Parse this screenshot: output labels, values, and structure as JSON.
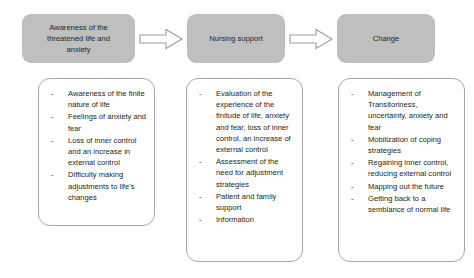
{
  "diagram": {
    "colors": {
      "header_fill": "#bfbfbf",
      "box_border": "#a6a6a6",
      "text": "#231f20",
      "background": "#ffffff"
    },
    "bullet_marker": "-",
    "arrows": [
      {
        "name": "arrow-stage-1-to-2",
        "direction": "right"
      },
      {
        "name": "arrow-stage-2-to-3",
        "direction": "right"
      }
    ],
    "stages": [
      {
        "header": "Awareness of the\nthreatened life and\nanxiety",
        "items": [
          "Awareness of the finite nature of life",
          "Feelings of anxiety and fear",
          "Loss of inner control and an increase in external control",
          "Difficulty making adjustments to life's changes"
        ]
      },
      {
        "header": "Nursing support",
        "items": [
          "Evaluation of the experience of the finitude of life, anxiety and fear, loss of inner control, an increase of external control",
          "Assessment of the need for adjustment strategies",
          "Patient and family support",
          "Information"
        ]
      },
      {
        "header": "Change",
        "items": [
          "Management of Transitoriness, uncertainty, anxiety and fear",
          "Mobilization of coping strategies",
          "Regaining inner control, reducing external control",
          "Mapping out the future",
          "Getting back to a semblance of normal life"
        ]
      }
    ]
  }
}
